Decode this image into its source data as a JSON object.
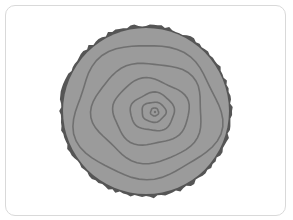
{
  "figure": {
    "frame": {
      "x": 5,
      "y": 5,
      "width": 281,
      "height": 211,
      "radius": 10,
      "border_color": "#d9d9d9"
    },
    "stump": {
      "cx": 146,
      "cy": 111,
      "r": 86,
      "fill_color": "#9b9b9b",
      "bark_color": "#555555",
      "bark_width": 3
    },
    "rings": {
      "center": {
        "cx": 155,
        "cy": 112
      },
      "color": "#707070",
      "stroke_width": 1.6,
      "radii": [
        {
          "rx": 4,
          "ry": 4
        },
        {
          "rx": 12,
          "ry": 10
        },
        {
          "rx": 22,
          "ry": 19
        },
        {
          "rx": 38,
          "ry": 33
        },
        {
          "rx": 55,
          "ry": 50
        },
        {
          "rx": 73,
          "ry": 67
        }
      ]
    },
    "pith_dot": {
      "cx": 155,
      "cy": 112,
      "r": 1.2
    }
  }
}
